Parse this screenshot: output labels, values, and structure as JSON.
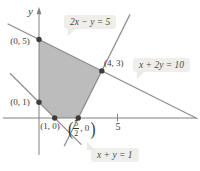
{
  "diagram": {
    "colors": {
      "region_fill": "#bcbcbc",
      "line": "#8c8c8c",
      "axis": "#808080",
      "dot": "#3d3d3d",
      "text": "#3b3b3b",
      "label_bg": "#f0eeea"
    },
    "axes": {
      "y_label": "y",
      "x_tick_label": "5",
      "x_tick_value": 5,
      "x_axis": {
        "from": [
          -2.3,
          0
        ],
        "to": [
          10.0,
          0
        ]
      },
      "y_axis": {
        "from": [
          0,
          -2.35
        ],
        "to": [
          0,
          6.9
        ],
        "arrow": "up"
      }
    },
    "equations": [
      {
        "id": "line-2x-y-5",
        "label": "2x − y = 5",
        "from": [
          1.6,
          -1.8
        ],
        "to": [
          5.8,
          6.6
        ]
      },
      {
        "id": "line-x-2y-10",
        "label": "x + 2y = 10",
        "from": [
          -2.0,
          6.0
        ],
        "to": [
          10.1,
          -0.05
        ]
      },
      {
        "id": "line-x-y-1",
        "label": "x + y = 1",
        "from": [
          -1.85,
          2.85
        ],
        "to": [
          2.7,
          -1.7
        ]
      }
    ],
    "region_vertices": [
      [
        0,
        5
      ],
      [
        4,
        3
      ],
      [
        2.5,
        0
      ],
      [
        1,
        0
      ],
      [
        0,
        1
      ]
    ],
    "points": [
      {
        "x": 0,
        "y": 5
      },
      {
        "x": 4,
        "y": 3
      },
      {
        "x": 2.5,
        "y": 0
      },
      {
        "x": 1,
        "y": 0
      },
      {
        "x": 0,
        "y": 1
      }
    ],
    "point_labels": {
      "p05": "(0, 5)",
      "p01": "(0, 1)",
      "p10": "(1, 0)",
      "p43": "(4, 3)"
    },
    "fraction_point": {
      "open": "(",
      "numerator": "5",
      "denominator": "2",
      "suffix": ", 0",
      "close": ")"
    }
  }
}
